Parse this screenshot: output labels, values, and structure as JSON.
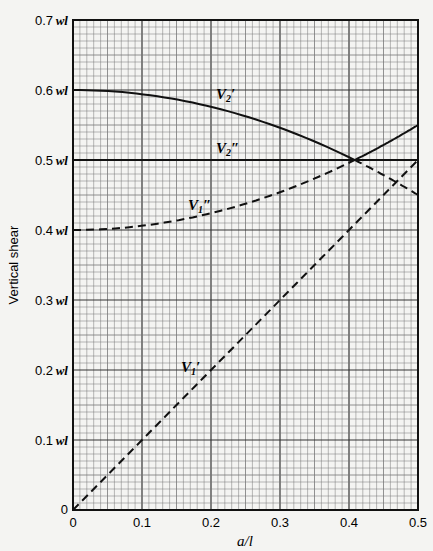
{
  "chart_data": {
    "type": "line",
    "title": "",
    "xlabel": "a/l",
    "ylabel": "Vertical shear",
    "xlim": [
      0,
      0.5
    ],
    "ylim": [
      0,
      0.7
    ],
    "grid": true,
    "x_ticks": [
      "0",
      "0.1",
      "0.2",
      "0.3",
      "0.4",
      "0.5"
    ],
    "y_ticks": [
      "0",
      "0.1 wl",
      "0.2 wl",
      "0.3 wl",
      "0.4 wl",
      "0.5 wl",
      "0.6 wl",
      "0.7 wl"
    ],
    "x": [
      0,
      0.05,
      0.1,
      0.15,
      0.2,
      0.25,
      0.3,
      0.35,
      0.4,
      0.408,
      0.45,
      0.5
    ],
    "series": [
      {
        "name": "V2'",
        "style": "solid then dashed after intersection",
        "values": [
          0.6,
          0.5985,
          0.594,
          0.5865,
          0.576,
          0.5625,
          0.546,
          0.5265,
          0.504,
          0.5,
          0.4785,
          0.45
        ]
      },
      {
        "name": "V2''",
        "style": "solid",
        "values": [
          0.5,
          0.5,
          0.5,
          0.5,
          0.5,
          0.5,
          0.5,
          0.5,
          0.5,
          0.5,
          0.5,
          0.5
        ]
      },
      {
        "name": "V1''",
        "style": "dashed then solid after intersection",
        "values": [
          0.4,
          0.4015,
          0.406,
          0.4135,
          0.424,
          0.4375,
          0.454,
          0.4735,
          0.496,
          0.5,
          0.5215,
          0.55
        ]
      },
      {
        "name": "V1'",
        "style": "dash-dot",
        "values": [
          0,
          0.05,
          0.1,
          0.15,
          0.2,
          0.25,
          0.3,
          0.35,
          0.4,
          0.408,
          0.45,
          0.5
        ]
      }
    ],
    "annotations": [
      "V2'",
      "V2''",
      "V1''",
      "V1'"
    ]
  },
  "labels": {
    "xlabel": "a/l",
    "ylabel": "Vertical shear",
    "origin": "0",
    "wl": "wl",
    "y_nums": [
      "0.1",
      "0.2",
      "0.3",
      "0.4",
      "0.5",
      "0.6",
      "0.7"
    ],
    "x_ticks": [
      "0",
      "0.1",
      "0.2",
      "0.3",
      "0.4",
      "0.5"
    ],
    "curve_labels": [
      "V2′",
      "V2″",
      "V1″",
      "V1′"
    ]
  }
}
